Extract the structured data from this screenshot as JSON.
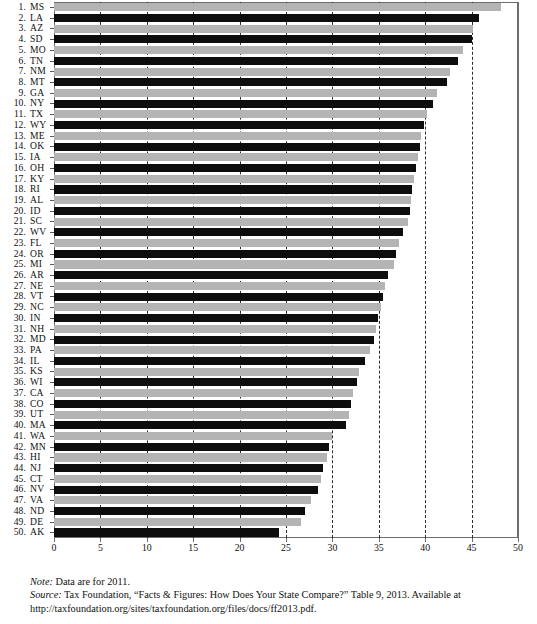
{
  "figure": {
    "note_lead": "Note:",
    "note_text": " Data are for 2011.",
    "source_lead": "Source:",
    "source_text": " Tax Foundation, “Facts & Figures: How Does Your State Compare?” Table 9, 2013. Available at http://taxfoundation.org/sites/taxfoundation.org/files/docs/ff2013.pdf."
  },
  "chart_data": {
    "type": "bar",
    "orientation": "horizontal",
    "title": "",
    "xlabel": "",
    "ylabel": "",
    "xlim": [
      0,
      50
    ],
    "xticks": [
      0,
      5,
      10,
      15,
      20,
      25,
      30,
      35,
      40,
      45,
      50
    ],
    "grid": "vertical dashed gridlines at each tick",
    "legend": "none",
    "bar_colors": [
      "#0d0d0d",
      "#b4b4b4"
    ],
    "categories": [
      "MS",
      "LA",
      "AZ",
      "SD",
      "MO",
      "TN",
      "NM",
      "MT",
      "GA",
      "NY",
      "TX",
      "WY",
      "ME",
      "OK",
      "IA",
      "OH",
      "KY",
      "RI",
      "AL",
      "ID",
      "SC",
      "WV",
      "FL",
      "OR",
      "MI",
      "AR",
      "NE",
      "VT",
      "NC",
      "IN",
      "NH",
      "MD",
      "PA",
      "IL",
      "KS",
      "WI",
      "CA",
      "CO",
      "UT",
      "MA",
      "WA",
      "MN",
      "HI",
      "NJ",
      "CT",
      "NV",
      "VA",
      "ND",
      "DE",
      "AK"
    ],
    "ranks": [
      1,
      2,
      3,
      4,
      5,
      6,
      7,
      8,
      9,
      10,
      11,
      12,
      13,
      14,
      15,
      16,
      17,
      18,
      19,
      20,
      21,
      22,
      23,
      24,
      25,
      26,
      27,
      28,
      29,
      30,
      31,
      32,
      33,
      34,
      35,
      36,
      37,
      38,
      39,
      40,
      41,
      42,
      43,
      44,
      45,
      46,
      47,
      48,
      49,
      50
    ],
    "values": [
      48.2,
      45.8,
      45.2,
      45.0,
      44.1,
      43.5,
      42.7,
      42.3,
      41.3,
      40.8,
      40.2,
      39.9,
      39.6,
      39.4,
      39.2,
      39.0,
      38.8,
      38.6,
      38.5,
      38.4,
      38.2,
      37.6,
      37.2,
      36.9,
      36.6,
      36.0,
      35.7,
      35.4,
      35.2,
      34.9,
      34.7,
      34.5,
      34.1,
      33.5,
      32.9,
      32.6,
      32.2,
      32.0,
      31.8,
      31.5,
      30.0,
      29.6,
      29.4,
      29.0,
      28.8,
      28.4,
      27.7,
      27.1,
      26.6,
      24.2
    ],
    "shades": [
      "light",
      "dark",
      "light",
      "dark",
      "light",
      "dark",
      "light",
      "dark",
      "light",
      "dark",
      "light",
      "dark",
      "light",
      "dark",
      "light",
      "dark",
      "light",
      "dark",
      "light",
      "dark",
      "light",
      "dark",
      "light",
      "dark",
      "light",
      "dark",
      "light",
      "dark",
      "light",
      "dark",
      "light",
      "dark",
      "light",
      "dark",
      "light",
      "dark",
      "light",
      "dark",
      "light",
      "dark",
      "light",
      "dark",
      "light",
      "dark",
      "light",
      "dark",
      "light",
      "dark",
      "light",
      "dark"
    ]
  }
}
